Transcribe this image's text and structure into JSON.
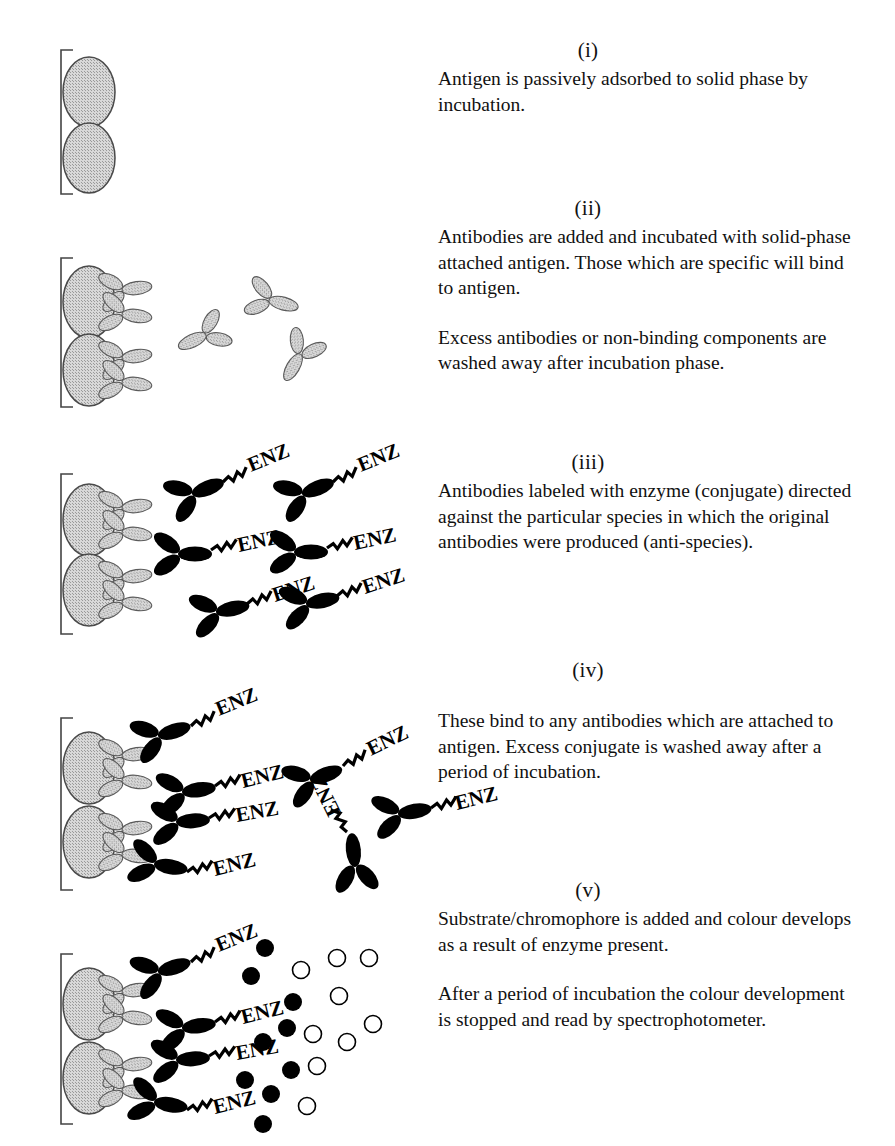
{
  "figure": {
    "colors": {
      "antigen_fill": "#c9c9c9",
      "antigen_stroke": "#4a4a4a",
      "antibody_fill": "#c9c9c9",
      "antibody_stroke": "#555555",
      "conjugate_fill": "#000000",
      "solid_phase_stroke": "#444444",
      "substrate_filled": "#000000",
      "substrate_open": "#ffffff",
      "text": "#111111"
    },
    "enzyme_label": "ENZ"
  },
  "steps": [
    {
      "roman": "(i)",
      "paragraphs": [
        "Antigen is passively adsorbed to solid phase by incubation."
      ],
      "diagram": {
        "solid_phase": true,
        "antigens": 2,
        "antibodies_bound": 0,
        "antibodies_free": 0,
        "conjugates_bound": 0,
        "conjugates_free": 0,
        "substrate_filled": 0,
        "substrate_open": 0
      }
    },
    {
      "roman": "(ii)",
      "paragraphs": [
        "Antibodies are added and incubated with solid-phase attached antigen. Those which are specific will bind to antigen.",
        "Excess antibodies or non-binding components are washed away after incubation phase."
      ],
      "diagram": {
        "solid_phase": true,
        "antigens": 2,
        "antibodies_bound": 4,
        "antibodies_free": 3,
        "conjugates_bound": 0,
        "conjugates_free": 0,
        "substrate_filled": 0,
        "substrate_open": 0
      }
    },
    {
      "roman": "(iii)",
      "paragraphs": [
        "Antibodies labeled with enzyme (conjugate)  directed against the particular species in which the original antibodies were produced (anti-species)."
      ],
      "diagram": {
        "solid_phase": true,
        "antigens": 2,
        "antibodies_bound": 4,
        "antibodies_free": 0,
        "conjugates_bound": 0,
        "conjugates_free": 6,
        "substrate_filled": 0,
        "substrate_open": 0
      }
    },
    {
      "roman": "(iv)",
      "paragraphs": [
        "These bind to any antibodies which are attached to antigen. Excess conjugate is washed away after a period of incubation."
      ],
      "diagram": {
        "solid_phase": true,
        "antigens": 2,
        "antibodies_bound": 4,
        "antibodies_free": 0,
        "conjugates_bound": 4,
        "conjugates_free": 3,
        "substrate_filled": 0,
        "substrate_open": 0
      }
    },
    {
      "roman": "(v)",
      "paragraphs": [
        "Substrate/chromophore is added and colour develops as a result of enzyme present.",
        "After a period of incubation the colour development is stopped and read by spectrophotometer."
      ],
      "diagram": {
        "solid_phase": true,
        "antigens": 2,
        "antibodies_bound": 4,
        "antibodies_free": 0,
        "conjugates_bound": 4,
        "conjugates_free": 0,
        "substrate_filled": 9,
        "substrate_open": 9
      }
    }
  ]
}
